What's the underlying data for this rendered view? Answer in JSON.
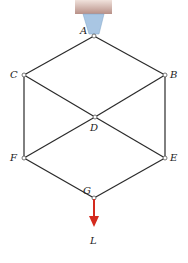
{
  "diagram": {
    "nodes": [
      {
        "id": "A",
        "label": "A"
      },
      {
        "id": "B",
        "label": "B"
      },
      {
        "id": "C",
        "label": "C"
      },
      {
        "id": "D",
        "label": "D"
      },
      {
        "id": "E",
        "label": "E"
      },
      {
        "id": "F",
        "label": "F"
      },
      {
        "id": "G",
        "label": "G"
      }
    ],
    "members": [
      [
        "A",
        "C"
      ],
      [
        "A",
        "B"
      ],
      [
        "C",
        "D"
      ],
      [
        "B",
        "D"
      ],
      [
        "C",
        "F"
      ],
      [
        "B",
        "E"
      ],
      [
        "D",
        "F"
      ],
      [
        "D",
        "E"
      ],
      [
        "F",
        "G"
      ],
      [
        "E",
        "G"
      ]
    ],
    "load": {
      "label": "L",
      "at": "G",
      "direction": "down"
    },
    "support": {
      "at": "A",
      "type": "ceiling-pin"
    },
    "colors": {
      "member": "#2a2a2a",
      "load": "#d42a1e",
      "support": "#a9c6e3",
      "ceiling": "#c9a7a0"
    }
  }
}
